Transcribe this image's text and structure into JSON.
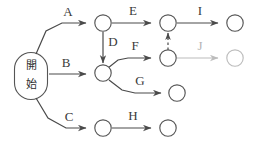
{
  "diagram": {
    "start_node": {
      "label_line1": "開",
      "label_line2": "始",
      "full_label": "開始"
    },
    "colors": {
      "stroke": "#4a4a4a",
      "node_stroke": "#555555",
      "muted": "#bcbcbc",
      "text": "#3a3a3a",
      "background": "#ffffff"
    },
    "edges": [
      {
        "id": "A",
        "label": "A",
        "from": "start",
        "to": "n1",
        "style": "solid",
        "muted": false
      },
      {
        "id": "B",
        "label": "B",
        "from": "start",
        "to": "n2",
        "style": "solid",
        "muted": false
      },
      {
        "id": "C",
        "label": "C",
        "from": "start",
        "to": "n3",
        "style": "solid",
        "muted": false
      },
      {
        "id": "D",
        "label": "D",
        "from": "n1",
        "to": "n2",
        "style": "solid",
        "muted": false
      },
      {
        "id": "E",
        "label": "E",
        "from": "n1",
        "to": "n4",
        "style": "solid",
        "muted": false
      },
      {
        "id": "F",
        "label": "F",
        "from": "n2",
        "to": "n5",
        "style": "solid",
        "muted": false
      },
      {
        "id": "G",
        "label": "G",
        "from": "n2",
        "to": "n6",
        "style": "solid",
        "muted": false
      },
      {
        "id": "H",
        "label": "H",
        "from": "n3",
        "to": "n7",
        "style": "solid",
        "muted": false
      },
      {
        "id": "I",
        "label": "I",
        "from": "n4",
        "to": "n8",
        "style": "solid",
        "muted": false
      },
      {
        "id": "J",
        "label": "J",
        "from": "n5",
        "to": "n9",
        "style": "solid",
        "muted": true
      },
      {
        "id": "K",
        "label": "",
        "from": "n5",
        "to": "n4",
        "style": "dashed",
        "muted": false
      }
    ],
    "nodes": [
      {
        "id": "n1",
        "muted": false
      },
      {
        "id": "n2",
        "muted": false
      },
      {
        "id": "n3",
        "muted": false
      },
      {
        "id": "n4",
        "muted": false
      },
      {
        "id": "n5",
        "muted": false
      },
      {
        "id": "n6",
        "muted": false
      },
      {
        "id": "n7",
        "muted": false
      },
      {
        "id": "n8",
        "muted": false
      },
      {
        "id": "n9",
        "muted": true
      }
    ]
  }
}
